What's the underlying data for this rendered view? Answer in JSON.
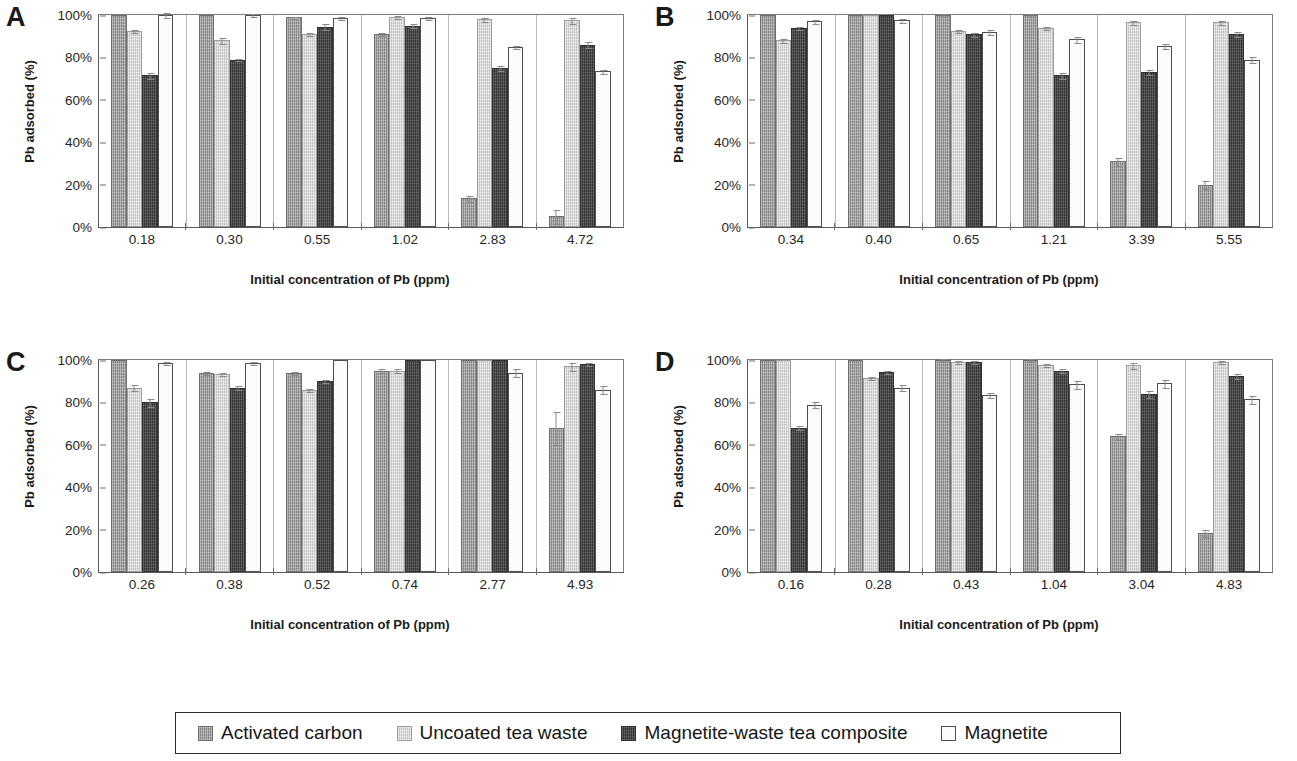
{
  "figure": {
    "ylabel": "Pb adsorbed (%)",
    "xlabel": "Initial concentration of Pb (ppm)",
    "yticks": [
      "100%",
      "80%",
      "60%",
      "40%",
      "20%",
      "0%"
    ]
  },
  "legend": {
    "items": [
      {
        "label": "Activated carbon",
        "swatch": "filled-medium-grey-square",
        "color": "#9a9a9a"
      },
      {
        "label": "Uncoated tea waste",
        "swatch": "filled-light-grey-square",
        "color": "#d8d8d8"
      },
      {
        "label": "Magnetite-waste tea composite",
        "swatch": "filled-dark-grey-square",
        "color": "#4a4a4a"
      },
      {
        "label": "Magnetite",
        "swatch": "open-white-square",
        "color": "#fbfbfb"
      }
    ]
  },
  "panels": [
    {
      "letter": "A",
      "ylabel": "Pb adsorbed (%)",
      "xlabel": "Initial concentration of Pb (ppm)"
    },
    {
      "letter": "B",
      "ylabel": "Pb adsorbed (%)",
      "xlabel": "Initial concentration of Pb (ppm)"
    },
    {
      "letter": "C",
      "ylabel": "Pb adsorbed (%)",
      "xlabel": "Initial concentration of Pb (ppm)"
    },
    {
      "letter": "D",
      "ylabel": "Pb adsorbed (%)",
      "xlabel": "Initial concentration of Pb (ppm)"
    }
  ],
  "chart_data": [
    {
      "panel": "A",
      "type": "bar",
      "title": "A",
      "xlabel": "Initial concentration of Pb (ppm)",
      "ylabel": "Pb adsorbed (%)",
      "ylim": [
        0,
        100
      ],
      "yticks": [
        0,
        20,
        40,
        60,
        80,
        100
      ],
      "grid": false,
      "legend_position": "bottom-shared",
      "categories": [
        "0.18",
        "0.30",
        "0.55",
        "1.02",
        "2.83",
        "4.72"
      ],
      "series": [
        {
          "name": "Activated carbon",
          "values": [
            100,
            100,
            99,
            91,
            13.5,
            5
          ],
          "errors": [
            0,
            0,
            0.7,
            1,
            1.5,
            3.5
          ]
        },
        {
          "name": "Uncoated tea waste",
          "values": [
            92.5,
            88,
            91,
            99,
            98,
            97.5
          ],
          "errors": [
            1,
            1.5,
            1,
            0.8,
            1.2,
            1.5
          ]
        },
        {
          "name": "Magnetite-waste tea composite",
          "values": [
            71.5,
            79,
            94.5,
            95,
            75,
            86
          ],
          "errors": [
            1.5,
            0.8,
            1.5,
            1,
            1.2,
            1.5
          ]
        },
        {
          "name": "Magnetite",
          "values": [
            100,
            100,
            98.5,
            98.5,
            85,
            73.5
          ],
          "errors": [
            1.5,
            1,
            1,
            1,
            1,
            1.2
          ]
        }
      ]
    },
    {
      "panel": "B",
      "type": "bar",
      "title": "B",
      "xlabel": "Initial concentration of Pb (ppm)",
      "ylabel": "Pb adsorbed (%)",
      "ylim": [
        0,
        100
      ],
      "yticks": [
        0,
        20,
        40,
        60,
        80,
        100
      ],
      "grid": false,
      "legend_position": "bottom-shared",
      "categories": [
        "0.34",
        "0.40",
        "0.65",
        "1.21",
        "3.39",
        "5.55"
      ],
      "series": [
        {
          "name": "Activated carbon",
          "values": [
            100,
            100,
            100,
            100,
            31,
            20
          ],
          "errors": [
            0,
            0,
            0.8,
            0.8,
            2,
            2
          ]
        },
        {
          "name": "Uncoated tea waste",
          "values": [
            88,
            100,
            92.5,
            94,
            96.5,
            96.5
          ],
          "errors": [
            1.2,
            0,
            1,
            1,
            1.2,
            1.2
          ]
        },
        {
          "name": "Magnetite-waste tea composite",
          "values": [
            94,
            100,
            91,
            71.5,
            73,
            91
          ],
          "errors": [
            1,
            0,
            1.2,
            1.5,
            1.5,
            1.5
          ]
        },
        {
          "name": "Magnetite",
          "values": [
            97,
            97.5,
            92,
            88.5,
            85.5,
            79
          ],
          "errors": [
            1.2,
            1.2,
            1.5,
            1.5,
            1.5,
            1.5
          ]
        }
      ]
    },
    {
      "panel": "C",
      "type": "bar",
      "title": "C",
      "xlabel": "Initial concentration of Pb (ppm)",
      "ylabel": "Pb adsorbed (%)",
      "ylim": [
        0,
        100
      ],
      "yticks": [
        0,
        20,
        40,
        60,
        80,
        100
      ],
      "grid": false,
      "legend_position": "bottom-shared",
      "categories": [
        "0.26",
        "0.38",
        "0.52",
        "0.74",
        "2.77",
        "4.93"
      ],
      "series": [
        {
          "name": "Activated carbon",
          "values": [
            100,
            94,
            94,
            95,
            100,
            68
          ],
          "errors": [
            0,
            1,
            1,
            1,
            0,
            8
          ]
        },
        {
          "name": "Uncoated tea waste",
          "values": [
            87,
            93.5,
            86,
            95,
            100,
            97
          ],
          "errors": [
            1.5,
            1,
            1,
            1,
            0,
            2
          ]
        },
        {
          "name": "Magnetite-waste tea composite",
          "values": [
            80,
            87,
            90,
            100,
            100,
            98
          ],
          "errors": [
            2,
            1.2,
            1,
            0,
            0,
            1
          ]
        },
        {
          "name": "Magnetite",
          "values": [
            98.5,
            98.5,
            100,
            100,
            94,
            86
          ],
          "errors": [
            1,
            0.8,
            0,
            0,
            2,
            2
          ]
        }
      ]
    },
    {
      "panel": "D",
      "type": "bar",
      "title": "D",
      "xlabel": "Initial concentration of Pb (ppm)",
      "ylabel": "Pb adsorbed (%)",
      "ylim": [
        0,
        100
      ],
      "yticks": [
        0,
        20,
        40,
        60,
        80,
        100
      ],
      "grid": false,
      "legend_position": "bottom-shared",
      "categories": [
        "0.16",
        "0.28",
        "0.43",
        "1.04",
        "3.04",
        "4.83"
      ],
      "series": [
        {
          "name": "Activated carbon",
          "values": [
            100,
            100,
            100,
            100,
            64,
            18.5
          ],
          "errors": [
            0,
            0,
            0.8,
            0.8,
            1.5,
            2
          ]
        },
        {
          "name": "Uncoated tea waste",
          "values": [
            100,
            91.5,
            99,
            97.5,
            97.5,
            99
          ],
          "errors": [
            0,
            1,
            0.8,
            1,
            1.5,
            1
          ]
        },
        {
          "name": "Magnetite-waste tea composite",
          "values": [
            68,
            94.5,
            99,
            95,
            84,
            92.5
          ],
          "errors": [
            1.2,
            1,
            0.8,
            1,
            2,
            1.5
          ]
        },
        {
          "name": "Magnetite",
          "values": [
            79,
            87,
            83.5,
            88.5,
            89,
            81.5
          ],
          "errors": [
            1.5,
            1.5,
            1.5,
            2,
            2,
            2
          ]
        }
      ]
    }
  ]
}
